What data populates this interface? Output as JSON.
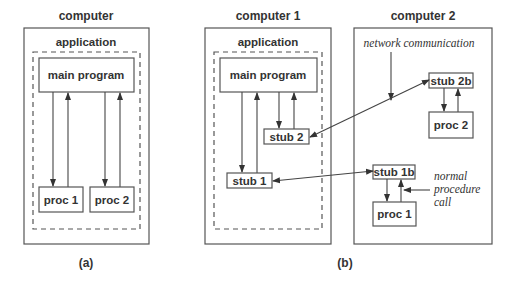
{
  "diagram_a": {
    "caption": "(a)",
    "computer_label": "computer",
    "application_label": "application",
    "main_program": "main program",
    "procs": [
      "proc 1",
      "proc 2"
    ]
  },
  "diagram_b": {
    "caption": "(b)",
    "computer1": {
      "label": "computer 1",
      "application_label": "application",
      "main_program": "main program",
      "stubs": [
        "stub 1",
        "stub 2"
      ]
    },
    "computer2": {
      "label": "computer 2",
      "network_label": "network communication",
      "stubs": [
        "stub 2b",
        "stub 1b"
      ],
      "procs": [
        "proc 2",
        "proc 1"
      ],
      "normal_call_label": [
        "normal",
        "procedure",
        "call"
      ]
    }
  },
  "colors": {
    "stroke": "#555555",
    "text": "#333333",
    "background": "#ffffff"
  }
}
